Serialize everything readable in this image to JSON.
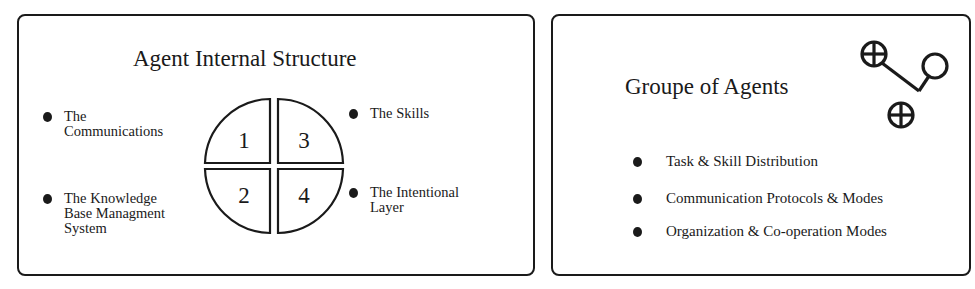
{
  "left_panel": {
    "title": "Agent Internal Structure",
    "items": [
      {
        "label": "The\nCommunications",
        "quadrant": "1"
      },
      {
        "label": "The Knowledge\nBase Managment\nSystem",
        "quadrant": "2"
      },
      {
        "label": "The Skills",
        "quadrant": "3"
      },
      {
        "label": "The Intentional\nLayer",
        "quadrant": "4"
      }
    ],
    "quadrants": [
      "1",
      "2",
      "3",
      "4"
    ],
    "icons": {
      "bullet": "filled-circle-bullet",
      "diagram": "quartered-circle"
    }
  },
  "right_panel": {
    "title": "Groupe of Agents",
    "items": [
      {
        "label": "Task & Skill Distribution"
      },
      {
        "label": "Communication Protocols & Modes"
      },
      {
        "label": "Organization & Co-operation Modes"
      }
    ],
    "icons": {
      "bullet": "filled-circle-bullet",
      "network": "connected-agent-nodes"
    }
  },
  "colors": {
    "ink": "#1a1a1a",
    "background": "#ffffff"
  }
}
